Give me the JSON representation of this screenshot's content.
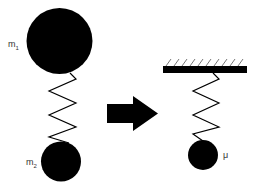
{
  "diagram": {
    "left_system": {
      "mass1_label": "m",
      "mass1_sub": "1",
      "mass2_label": "m",
      "mass2_sub": "2"
    },
    "right_system": {
      "reduced_mass_label": "μ",
      "support": "fixed ceiling"
    },
    "colors": {
      "ink": "#000000",
      "background": "#ffffff",
      "label": "#333333"
    }
  }
}
